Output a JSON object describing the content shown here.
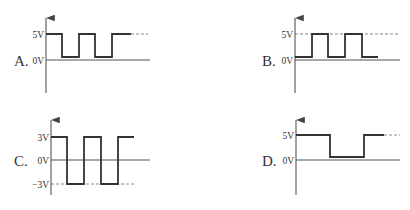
{
  "colors": {
    "ink": "#333333",
    "axis": "#555555",
    "dashed": "#888888",
    "background": "#ffffff"
  },
  "panels": [
    {
      "id": "A",
      "label": "A.",
      "label_pos": [
        14,
        66
      ],
      "axis": {
        "x": 46,
        "y_top": 15,
        "y_bottom": 93
      },
      "zero_line": {
        "y": 60,
        "x_end": 150
      },
      "ticks": [
        {
          "text": "5V",
          "y": 34
        },
        {
          "text": "0V",
          "y": 60
        }
      ],
      "dashed": [
        {
          "y": 34,
          "x1": 131,
          "x2": 148
        }
      ],
      "waveform": [
        [
          46,
          34
        ],
        [
          62,
          34
        ],
        [
          62,
          57
        ],
        [
          79,
          57
        ],
        [
          79,
          34
        ],
        [
          95,
          34
        ],
        [
          95,
          57
        ],
        [
          112,
          57
        ],
        [
          112,
          34
        ],
        [
          131,
          34
        ]
      ],
      "description": "Square wave between 5V and ~0V, starting high"
    },
    {
      "id": "B",
      "label": "B.",
      "label_pos": [
        262,
        66
      ],
      "axis": {
        "x": 295,
        "y_top": 15,
        "y_bottom": 93
      },
      "zero_line": {
        "y": 60,
        "x_end": 400
      },
      "ticks": [
        {
          "text": "5V",
          "y": 34
        },
        {
          "text": "0V",
          "y": 60
        }
      ],
      "dashed": [
        {
          "y": 34,
          "x1": 295,
          "x2": 400
        }
      ],
      "waveform": [
        [
          295,
          57
        ],
        [
          312,
          57
        ],
        [
          312,
          34
        ],
        [
          328,
          34
        ],
        [
          328,
          57
        ],
        [
          345,
          57
        ],
        [
          345,
          34
        ],
        [
          362,
          34
        ],
        [
          362,
          57
        ],
        [
          378,
          57
        ]
      ],
      "description": "Square wave between ~0V and 5V, starting low"
    },
    {
      "id": "C",
      "label": "C.",
      "label_pos": [
        14,
        166
      ],
      "axis": {
        "x": 51,
        "y_top": 117,
        "y_bottom": 195
      },
      "zero_line": {
        "y": 160,
        "x_end": 150
      },
      "ticks": [
        {
          "text": "3V",
          "y": 137
        },
        {
          "text": "0V",
          "y": 160
        },
        {
          "text": "−3V",
          "y": 184
        }
      ],
      "dashed": [
        {
          "y": 184,
          "x1": 51,
          "x2": 134
        }
      ],
      "waveform": [
        [
          51,
          137
        ],
        [
          67,
          137
        ],
        [
          67,
          184
        ],
        [
          84,
          184
        ],
        [
          84,
          137
        ],
        [
          101,
          137
        ],
        [
          101,
          184
        ],
        [
          118,
          184
        ],
        [
          118,
          137
        ],
        [
          134,
          137
        ]
      ],
      "description": "Square wave between +3V and -3V"
    },
    {
      "id": "D",
      "label": "D.",
      "label_pos": [
        262,
        166
      ],
      "axis": {
        "x": 296,
        "y_top": 117,
        "y_bottom": 195
      },
      "zero_line": {
        "y": 160,
        "x_end": 400
      },
      "ticks": [
        {
          "text": "5V",
          "y": 135
        },
        {
          "text": "0V",
          "y": 160
        }
      ],
      "dashed": [
        {
          "y": 135,
          "x1": 364,
          "x2": 400
        }
      ],
      "waveform": [
        [
          296,
          135
        ],
        [
          330,
          135
        ],
        [
          330,
          157
        ],
        [
          364,
          157
        ],
        [
          364,
          135
        ],
        [
          384,
          135
        ]
      ],
      "description": "Single low pulse, 5V baseline dropping to ~0V"
    }
  ]
}
